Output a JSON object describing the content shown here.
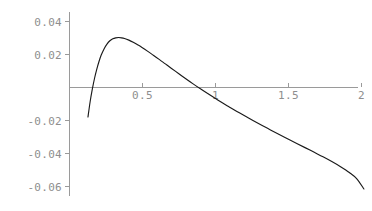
{
  "chart_data": {
    "type": "line",
    "title": "",
    "subtitle": "",
    "xlabel": "",
    "ylabel": "",
    "xlim": [
      0.0,
      2.05
    ],
    "ylim": [
      -0.065,
      0.048
    ],
    "grid": false,
    "legend": null,
    "background_color": "#ffffff",
    "axis_color": "#9a9a9a",
    "tick_label_color": "#8e8e8e",
    "curve_color": "#1a1a1a",
    "x_ticks": [
      {
        "value": 0.5,
        "label": "0.5"
      },
      {
        "value": 1.0,
        "label": "1"
      },
      {
        "value": 1.5,
        "label": "1.5"
      },
      {
        "value": 2.0,
        "label": "2"
      }
    ],
    "y_ticks": [
      {
        "value": 0.04,
        "label": "0.04"
      },
      {
        "value": 0.02,
        "label": "0.02"
      },
      {
        "value": -0.02,
        "label": "-0.02"
      },
      {
        "value": -0.04,
        "label": "-0.04"
      },
      {
        "value": -0.06,
        "label": "-0.06"
      }
    ],
    "annotations": {
      "zero_crossing_left_x": 0.155,
      "zero_crossing_right_x": 1.0,
      "peak_x": 0.29,
      "peak_y": 0.0445,
      "start_point": [
        0.13,
        -0.0182
      ],
      "end_point": [
        2.02,
        -0.0618
      ]
    },
    "series": [
      {
        "name": "curve",
        "x": [
          0.13,
          0.145,
          0.16,
          0.175,
          0.19,
          0.205,
          0.22,
          0.24,
          0.26,
          0.28,
          0.3,
          0.32,
          0.34,
          0.36,
          0.38,
          0.41,
          0.44,
          0.47,
          0.5,
          0.54,
          0.58,
          0.62,
          0.66,
          0.7,
          0.75,
          0.8,
          0.85,
          0.9,
          0.95,
          1.0,
          1.05,
          1.1,
          1.15,
          1.2,
          1.26,
          1.32,
          1.38,
          1.44,
          1.5,
          1.56,
          1.62,
          1.68,
          1.74,
          1.8,
          1.86,
          1.92,
          1.97,
          2.02
        ],
        "y": [
          -0.0182,
          -0.0088,
          -0.0012,
          0.0053,
          0.0107,
          0.0153,
          0.0192,
          0.0231,
          0.026,
          0.028,
          0.0292,
          0.0298,
          0.03,
          0.0298,
          0.0294,
          0.0284,
          0.0271,
          0.0256,
          0.024,
          0.0216,
          0.0191,
          0.0166,
          0.014,
          0.0114,
          0.0082,
          0.005,
          0.0019,
          -0.0011,
          -0.004,
          -0.0068,
          -0.0096,
          -0.0122,
          -0.0148,
          -0.0173,
          -0.0203,
          -0.0232,
          -0.026,
          -0.0288,
          -0.0315,
          -0.0342,
          -0.0369,
          -0.0396,
          -0.0423,
          -0.0452,
          -0.0483,
          -0.0518,
          -0.0555,
          -0.0618
        ]
      }
    ]
  },
  "plot": {
    "geometry": {
      "width": 372,
      "height": 211,
      "x_axis_pixel_y": 87,
      "y_axis_pixel_x": 69,
      "x_axis_pixel_start": 69,
      "x_axis_pixel_end": 358,
      "y_axis_pixel_top": 12,
      "y_axis_pixel_bottom": 196,
      "px_per_x_unit": 146.0,
      "px_per_y_unit": 1650.0,
      "tick_length": 4
    }
  }
}
